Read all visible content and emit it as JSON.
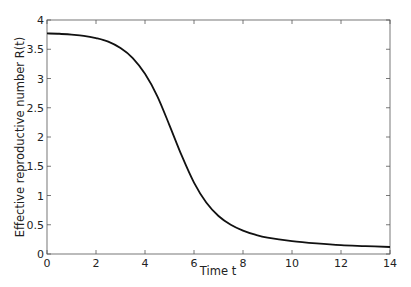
{
  "chart_data": {
    "type": "line",
    "title": "",
    "xlabel": "Time t",
    "ylabel": "Effective reproductive number R(t)",
    "xlim": [
      0,
      14
    ],
    "ylim": [
      0,
      4
    ],
    "xticks": [
      0,
      2,
      4,
      6,
      8,
      10,
      12,
      14
    ],
    "yticks": [
      0,
      0.5,
      1,
      1.5,
      2,
      2.5,
      3,
      3.5,
      4
    ],
    "xtick_labels": [
      "0",
      "2",
      "4",
      "6",
      "8",
      "10",
      "12",
      "14"
    ],
    "ytick_labels": [
      "0",
      "0.5",
      "1",
      "1.5",
      "2",
      "2.5",
      "3",
      "3.5",
      "4"
    ],
    "grid": false,
    "legend": null,
    "series": [
      {
        "name": "R(t)",
        "color": "#111111",
        "x": [
          0,
          0.5,
          1,
          1.5,
          2,
          2.5,
          3,
          3.5,
          4,
          4.5,
          5,
          5.5,
          6,
          6.5,
          7,
          7.5,
          8,
          8.5,
          9,
          10,
          11,
          12,
          13,
          14
        ],
        "y": [
          3.77,
          3.765,
          3.75,
          3.73,
          3.69,
          3.63,
          3.52,
          3.35,
          3.08,
          2.7,
          2.2,
          1.68,
          1.22,
          0.88,
          0.65,
          0.5,
          0.4,
          0.33,
          0.28,
          0.22,
          0.18,
          0.15,
          0.135,
          0.12
        ]
      }
    ]
  }
}
